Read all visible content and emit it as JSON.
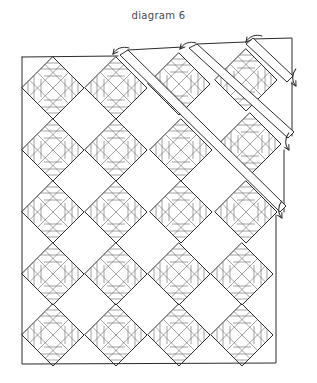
{
  "title": "diagram 6",
  "diagram": {
    "type": "quilt-layout",
    "grid": {
      "columns": 4,
      "rows": 5
    },
    "block": {
      "shape": "diamond",
      "half_width": 31,
      "pattern": "crosshatch with horizontal and vertical bars"
    },
    "column_centers_x": [
      53,
      116,
      179,
      242
    ],
    "row_centers_y": [
      88,
      150,
      212,
      274,
      335
    ],
    "frame": {
      "left": 22,
      "top": 57,
      "right": 276,
      "bottom": 364
    },
    "strips": [
      {
        "name": "strip-1",
        "from": [
          123,
          52
        ],
        "to": [
          283,
          210
        ],
        "width": 9
      },
      {
        "name": "strip-2",
        "from": [
          191,
          45
        ],
        "to": [
          291,
          138
        ],
        "width": 9
      }
    ],
    "corner_triangle": {
      "points": [
        [
          248,
          38
        ],
        [
          292,
          38
        ],
        [
          292,
          82
        ]
      ]
    },
    "arrows": [
      {
        "name": "arrow-1",
        "at": [
          118,
          50
        ],
        "direction": "down-left"
      },
      {
        "name": "arrow-2",
        "at": [
          182,
          45
        ],
        "direction": "down-left"
      },
      {
        "name": "arrow-3",
        "at": [
          246,
          38
        ],
        "direction": "down-left"
      },
      {
        "name": "arrow-4",
        "at": [
          289,
          148
        ],
        "direction": "down-left"
      },
      {
        "name": "arrow-5",
        "at": [
          283,
          213
        ],
        "direction": "down-left"
      },
      {
        "name": "arrow-6",
        "at": [
          294,
          82
        ],
        "direction": "down-left"
      }
    ],
    "colors": {
      "line": "#2b2b2b",
      "background": "#ffffff",
      "title": "#4a4a4a"
    }
  }
}
